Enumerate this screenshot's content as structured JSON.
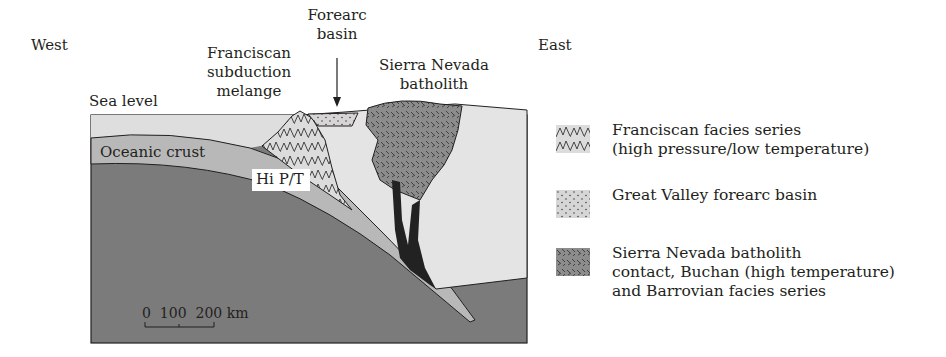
{
  "diagram": {
    "title_direction_west": "West",
    "title_direction_east": "East",
    "labels": {
      "franciscan": [
        "Franciscan",
        "subduction",
        "melange"
      ],
      "forearc": [
        "Forearc",
        "basin"
      ],
      "sierra": [
        "Sierra Nevada",
        "batholith"
      ],
      "sea_level": "Sea level",
      "oceanic_crust": "Oceanic crust",
      "hi_pt": "Hi P/T"
    },
    "scale_bar": {
      "label": "0  100  200 km",
      "ticks": [
        "0",
        "100",
        "200"
      ],
      "unit": "km"
    },
    "colors": {
      "mantle": "#7b7b7b",
      "oceanic_crust": "#b8b8b8",
      "continental_crust": "#e4e4e4",
      "sea": "#d9d9d9",
      "batholith": "#8c8c8c",
      "forearc": "#d6d6d6",
      "outline": "#231f20"
    }
  },
  "legend": {
    "items": [
      {
        "pattern": "franciscan-folded",
        "lines": [
          "Franciscan facies series",
          "(high pressure/low temperature)"
        ]
      },
      {
        "pattern": "forearc-dotted",
        "lines": [
          "Great Valley forearc basin"
        ]
      },
      {
        "pattern": "batholith-hatched",
        "lines": [
          "Sierra Nevada batholith",
          "contact, Buchan (high temperature)",
          "and Barrovian facies series"
        ]
      }
    ]
  }
}
